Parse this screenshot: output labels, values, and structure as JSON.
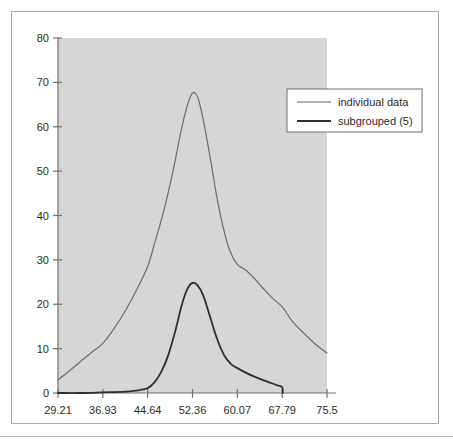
{
  "chart_data": {
    "type": "line",
    "title": "",
    "subtitle": "",
    "xlabel": "",
    "ylabel": "",
    "xlim": [
      29.21,
      75.5
    ],
    "ylim": [
      0,
      80
    ],
    "grid": false,
    "legend_position": "top-right",
    "plot_background": "#d6d6d6",
    "axis_color": "#808080",
    "x_tick_labels": [
      "29.21",
      "36.93",
      "44.64",
      "52.36",
      "60.07",
      "67.79",
      "75.5"
    ],
    "x_ticks": [
      29.21,
      36.93,
      44.64,
      52.36,
      60.07,
      67.79,
      75.5
    ],
    "y_tick_labels": [
      "0",
      "10",
      "20",
      "30",
      "40",
      "50",
      "60",
      "70",
      "80"
    ],
    "y_ticks": [
      0,
      10,
      20,
      30,
      40,
      50,
      60,
      70,
      80
    ],
    "series": [
      {
        "name": "individual data",
        "color": "#6b6b6b",
        "width": 1.2,
        "x": [
          29.21,
          31.0,
          33.0,
          35.0,
          36.93,
          39.0,
          41.0,
          42.8,
          44.64,
          46.0,
          47.5,
          49.0,
          50.3,
          51.4,
          52.36,
          53.3,
          54.3,
          55.4,
          56.5,
          57.6,
          58.8,
          60.07,
          61.5,
          63.0,
          64.5,
          66.0,
          67.79,
          69.5,
          71.5,
          73.5,
          75.5
        ],
        "y": [
          3.0,
          4.8,
          7.0,
          9.2,
          11.2,
          14.8,
          19.0,
          23.4,
          28.5,
          34.5,
          41.5,
          50.0,
          58.5,
          64.5,
          67.6,
          66.5,
          61.0,
          53.0,
          44.5,
          37.5,
          32.0,
          29.0,
          27.7,
          25.8,
          23.6,
          21.5,
          19.4,
          16.2,
          13.5,
          11.0,
          9.0
        ]
      },
      {
        "name": "subgrouped (5)",
        "color": "#2e2e2e",
        "width": 1.8,
        "x": [
          29.21,
          33.0,
          36.93,
          38.5,
          40.0,
          41.5,
          43.0,
          44.64,
          45.8,
          47.0,
          48.2,
          49.4,
          50.5,
          51.5,
          52.36,
          53.2,
          54.2,
          55.3,
          56.5,
          57.8,
          59.0,
          60.07,
          61.5,
          63.0,
          64.5,
          66.0,
          67.0,
          67.79,
          67.9
        ],
        "y": [
          0.0,
          0.0,
          0.15,
          0.2,
          0.25,
          0.35,
          0.6,
          1.1,
          2.4,
          4.8,
          8.6,
          14.0,
          19.8,
          23.5,
          24.8,
          24.3,
          22.0,
          17.5,
          12.5,
          8.5,
          6.5,
          5.6,
          4.6,
          3.7,
          2.9,
          2.2,
          1.7,
          1.3,
          0.0
        ]
      }
    ]
  },
  "legend": {
    "entries": [
      {
        "label": "individual data"
      },
      {
        "label": "subgrouped (5)"
      }
    ]
  }
}
